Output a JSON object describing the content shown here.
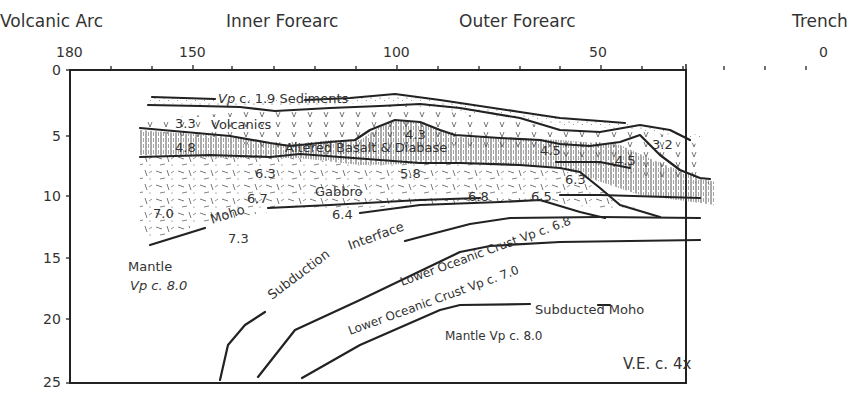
{
  "regions": {
    "volcanic_arc": "Volcanic Arc",
    "inner_forearc": "Inner Forearc",
    "outer_forearc": "Outer Forearc",
    "trench": "Trench"
  },
  "x_axis": {
    "ticks": [
      "180",
      "150",
      "100",
      "50",
      "0"
    ],
    "direction": "distance decreasing toward trench"
  },
  "y_axis": {
    "ticks": [
      "0",
      "5",
      "10",
      "15",
      "20",
      "25"
    ]
  },
  "layers": {
    "sediments": "Vp c. 1.9 Sediments",
    "sediments_vp_prefix": "Vp",
    "sediments_rest": " c. 1.9 Sediments",
    "volcanics": "Volcanics",
    "altered_basalt": "Altered Basalt & Diabase",
    "gabbro": "Gabbro",
    "moho": "Moho",
    "mantle": "Mantle",
    "mantle_vp": "Vp c. 8.0",
    "subduction_interface_1": "Subduction",
    "subduction_interface_2": "Interface",
    "lower_crust_1": "Lower Oceanic Crust Vp c. 6.8",
    "lower_crust_2": "Lower Oceanic Crust Vp c. 7.0",
    "subducted_moho": "Subducted Moho",
    "subducted_mantle": "Mantle Vp c. 8.0"
  },
  "velocities": {
    "v33": "3.3",
    "v48": "4.8",
    "v43": "4.3",
    "v45a": "4.5",
    "v45b": "4.5",
    "v32": "3.2",
    "v63a": "6.3",
    "v58": "5.8",
    "v63b": "6.3",
    "v67": "6.7",
    "v70": "7.0",
    "v64": "6.4",
    "v68": "6.8",
    "v65": "6.5",
    "v73": "7.3"
  },
  "annotation": {
    "vertical_exaggeration": "V.E. c. 4x"
  },
  "colors": {
    "line": "#222222",
    "text": "#333333",
    "background": "#ffffff"
  }
}
